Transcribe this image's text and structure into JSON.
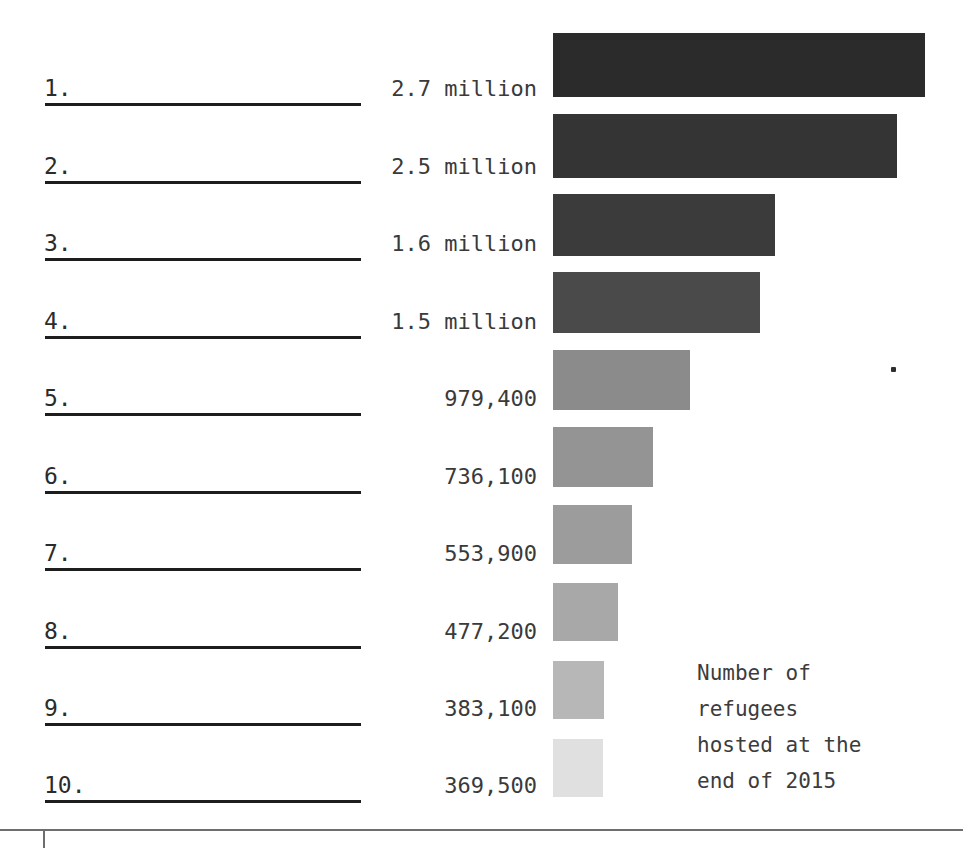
{
  "caption": {
    "lines": [
      "Number of",
      "refugees",
      "hosted at the",
      "end of 2015"
    ]
  },
  "chart_data": {
    "type": "bar",
    "orientation": "horizontal",
    "title": "",
    "subtitle": "",
    "xlabel": "",
    "ylabel": "",
    "annotation": "Number of refugees hosted at the end of 2015",
    "grid": false,
    "legend": "none",
    "axis_ranges": {
      "x": [
        0,
        2700000
      ]
    },
    "categories": [
      "1.",
      "2.",
      "3.",
      "4.",
      "5.",
      "6.",
      "7.",
      "8.",
      "9.",
      "10."
    ],
    "value_labels": [
      "2.7 million",
      "2.5 million",
      "1.6 million",
      "1.5 million",
      "979,400",
      "736,100",
      "553,900",
      "477,200",
      "383,100",
      "369,500"
    ],
    "values": [
      2700000,
      2500000,
      1600000,
      1500000,
      979400,
      736100,
      553900,
      477200,
      383100,
      369500
    ],
    "bar_colors": [
      "#2b2b2b",
      "#343434",
      "#3b3b3b",
      "#4a4a4a",
      "#8b8b8b",
      "#949494",
      "#9c9c9c",
      "#a8a8a8",
      "#b7b7b7",
      "#e0e0e0"
    ]
  },
  "rows": [
    {
      "rank": "1.",
      "value": "2.7 million",
      "bar_width": 372,
      "bar_top": 33,
      "bar_height": 64,
      "color": "#2b2b2b"
    },
    {
      "rank": "2.",
      "value": "2.5 million",
      "bar_width": 344,
      "bar_top": 114,
      "bar_height": 64,
      "color": "#343434"
    },
    {
      "rank": "3.",
      "value": "1.6 million",
      "bar_width": 222,
      "bar_top": 194,
      "bar_height": 62,
      "color": "#3b3b3b"
    },
    {
      "rank": "4.",
      "value": "1.5 million",
      "bar_width": 207,
      "bar_top": 272,
      "bar_height": 61,
      "color": "#4a4a4a"
    },
    {
      "rank": "5.",
      "value": "979,400",
      "bar_width": 137,
      "bar_top": 350,
      "bar_height": 60,
      "color": "#8b8b8b"
    },
    {
      "rank": "6.",
      "value": "736,100",
      "bar_width": 100,
      "bar_top": 427,
      "bar_height": 60,
      "color": "#949494"
    },
    {
      "rank": "7.",
      "value": "553,900",
      "bar_width": 79,
      "bar_top": 505,
      "bar_height": 59,
      "color": "#9c9c9c"
    },
    {
      "rank": "8.",
      "value": "477,200",
      "bar_width": 65,
      "bar_top": 583,
      "bar_height": 58,
      "color": "#a8a8a8"
    },
    {
      "rank": "9.",
      "value": "383,100",
      "bar_width": 51,
      "bar_top": 661,
      "bar_height": 58,
      "color": "#b7b7b7"
    },
    {
      "rank": "10.",
      "value": "369,500",
      "bar_width": 50,
      "bar_top": 739,
      "bar_height": 58,
      "color": "#e0e0e0"
    }
  ]
}
